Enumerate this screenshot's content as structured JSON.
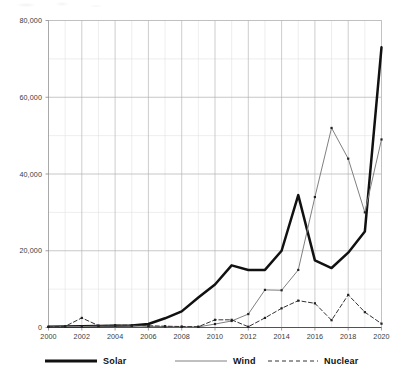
{
  "chart_data": {
    "type": "line",
    "title": "",
    "subtitle": "",
    "xlabel": "",
    "ylabel": "",
    "x": [
      2000,
      2001,
      2002,
      2003,
      2004,
      2005,
      2006,
      2007,
      2008,
      2009,
      2010,
      2011,
      2012,
      2013,
      2014,
      2015,
      2016,
      2017,
      2018,
      2019,
      2020
    ],
    "xlim": [
      2000,
      2020
    ],
    "ylim": [
      0,
      80000
    ],
    "grid": true,
    "y_major_ticks": [
      0,
      20000,
      40000,
      60000,
      80000
    ],
    "y_tick_labels": [
      "0",
      "20,000",
      "40,000",
      "60,000",
      "80,000"
    ],
    "y_minor_step": 10000,
    "x_major_ticks": [
      2000,
      2002,
      2004,
      2006,
      2008,
      2010,
      2012,
      2014,
      2016,
      2018,
      2020
    ],
    "x_tick_labels": [
      "2000",
      "2002",
      "2004",
      "2006",
      "2008",
      "2010",
      "2012",
      "2014",
      "2016",
      "2018",
      "2020"
    ],
    "x_minor_step": 1,
    "legend_position": "bottom",
    "series": [
      {
        "name": "Solar",
        "style": "solid-thick",
        "color": "#111111",
        "values": [
          200,
          250,
          300,
          400,
          450,
          500,
          900,
          2400,
          4200,
          7800,
          11200,
          16200,
          15000,
          15000,
          20000,
          34500,
          17500,
          15500,
          19500,
          25000,
          73000
        ]
      },
      {
        "name": "Wind",
        "style": "solid-thin",
        "color": "#808080",
        "values": [
          150,
          200,
          250,
          350,
          400,
          400,
          300,
          250,
          150,
          150,
          900,
          1700,
          3500,
          9800,
          9700,
          15000,
          34000,
          52000,
          44000,
          30000,
          49000
        ]
      },
      {
        "name": "Nuclear",
        "style": "dashed",
        "color": "#333333",
        "values": [
          150,
          300,
          2500,
          500,
          600,
          600,
          450,
          350,
          250,
          200,
          2000,
          2000,
          200,
          2500,
          5000,
          7000,
          6300,
          1900,
          8500,
          4000,
          1000
        ]
      }
    ]
  },
  "legend": {
    "items": [
      {
        "label": "Solar"
      },
      {
        "label": "Wind"
      },
      {
        "label": "Nuclear"
      }
    ]
  }
}
